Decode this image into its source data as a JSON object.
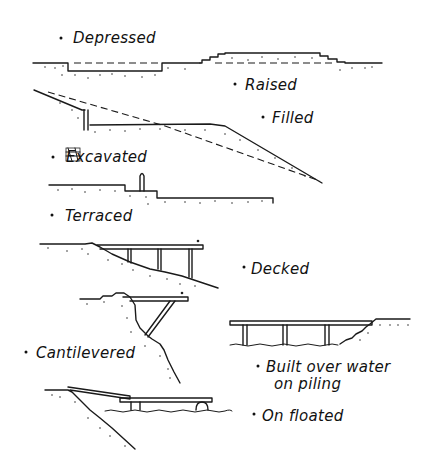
{
  "diagram": {
    "type": "hand-drawn section sketches",
    "ink_color": "#1a1a1a",
    "background": "#ffffff",
    "items": [
      {
        "id": "depressed",
        "label": "Depressed"
      },
      {
        "id": "raised",
        "label": "Raised"
      },
      {
        "id": "filled",
        "label": "Filled"
      },
      {
        "id": "excavated",
        "label": "Excavated",
        "note": "first letters scribbled over"
      },
      {
        "id": "terraced",
        "label": "Terraced"
      },
      {
        "id": "decked",
        "label": "Decked"
      },
      {
        "id": "cantilevered",
        "label": "Cantilevered"
      },
      {
        "id": "piling",
        "label": "Built over water",
        "label_line2": "on piling"
      },
      {
        "id": "floated",
        "label": "On floated"
      }
    ]
  }
}
